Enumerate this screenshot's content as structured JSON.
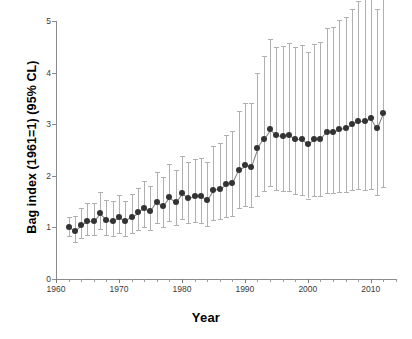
{
  "chart_data": {
    "type": "scatter",
    "title": "",
    "xlabel": "Year",
    "ylabel": "Bag index (1961=1) (95% CL)",
    "xlim": [
      1960,
      2014
    ],
    "ylim": [
      0,
      5
    ],
    "yticks": [
      0,
      1,
      2,
      3,
      4,
      5
    ],
    "xticks": [
      1960,
      1970,
      1980,
      1990,
      2000,
      2010
    ],
    "xtick_minor_step": 2,
    "grid": false,
    "legend": null,
    "error_bars": "95% CL",
    "marker_color": "#333333",
    "errorbar_color": "#b0b0b0",
    "x": [
      1962,
      1963,
      1964,
      1965,
      1966,
      1967,
      1968,
      1969,
      1970,
      1971,
      1972,
      1973,
      1974,
      1975,
      1976,
      1977,
      1978,
      1979,
      1980,
      1981,
      1982,
      1983,
      1984,
      1985,
      1986,
      1987,
      1988,
      1989,
      1990,
      1991,
      1992,
      1993,
      1994,
      1995,
      1996,
      1997,
      1998,
      1999,
      2000,
      2001,
      2002,
      2003,
      2004,
      2005,
      2006,
      2007,
      2008,
      2009,
      2010,
      2011,
      2012
    ],
    "values": [
      1.0,
      0.93,
      1.05,
      1.12,
      1.12,
      1.27,
      1.15,
      1.13,
      1.2,
      1.12,
      1.21,
      1.29,
      1.38,
      1.31,
      1.5,
      1.41,
      1.58,
      1.49,
      1.66,
      1.57,
      1.6,
      1.6,
      1.53,
      1.72,
      1.75,
      1.84,
      1.87,
      2.12,
      2.2,
      2.18,
      2.53,
      2.72,
      2.9,
      2.79,
      2.77,
      2.79,
      2.72,
      2.72,
      2.62,
      2.71,
      2.71,
      2.85,
      2.85,
      2.9,
      2.92,
      3.0,
      3.06,
      3.06,
      3.12,
      2.92,
      3.22
    ],
    "ci_low": [
      0.83,
      0.71,
      0.8,
      0.85,
      0.85,
      0.96,
      0.86,
      0.84,
      0.89,
      0.83,
      0.89,
      0.95,
      1.01,
      0.95,
      1.08,
      1.01,
      1.12,
      1.05,
      1.16,
      1.09,
      1.1,
      1.09,
      1.03,
      1.15,
      1.16,
      1.21,
      1.22,
      1.38,
      1.42,
      1.39,
      1.6,
      1.71,
      1.81,
      1.73,
      1.7,
      1.7,
      1.65,
      1.63,
      1.56,
      1.61,
      1.6,
      1.67,
      1.66,
      1.68,
      1.68,
      1.72,
      1.74,
      1.73,
      1.75,
      1.63,
      1.79
    ],
    "ci_high": [
      1.2,
      1.22,
      1.38,
      1.48,
      1.48,
      1.68,
      1.54,
      1.52,
      1.62,
      1.52,
      1.65,
      1.76,
      1.89,
      1.81,
      2.08,
      1.97,
      2.23,
      2.12,
      2.38,
      2.27,
      2.33,
      2.35,
      2.27,
      2.57,
      2.64,
      2.8,
      2.87,
      3.26,
      3.41,
      3.42,
      3.99,
      4.33,
      4.65,
      4.5,
      4.51,
      4.58,
      4.49,
      4.53,
      4.4,
      4.56,
      4.59,
      4.86,
      4.89,
      5.01,
      5.08,
      5.23,
      5.38,
      5.42,
      5.56,
      5.23,
      5.8
    ]
  },
  "axes": {
    "ylabel": "Bag index (1961=1) (95% CL)",
    "xlabel": "Year",
    "ytick_labels": [
      "0",
      "1",
      "2",
      "3",
      "4",
      "5"
    ],
    "xtick_labels": [
      "1960",
      "1970",
      "1980",
      "1990",
      "2000",
      "2010"
    ]
  }
}
